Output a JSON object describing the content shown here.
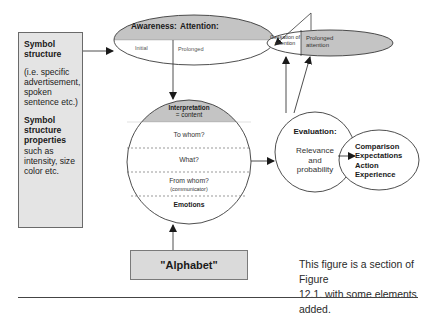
{
  "symbol_structure": {
    "title_line1": "Symbol",
    "title_line2": "structure",
    "example_lines": [
      "(i.e. specific",
      "advertisement,",
      "spoken",
      "sentence etc.)"
    ],
    "props_title_lines": [
      "Symbol",
      "structure",
      "properties"
    ],
    "props_lines": [
      "such as",
      "intensity, size",
      "color etc."
    ]
  },
  "awareness": {
    "label_left": "Awareness:",
    "label_right": "Attention:",
    "sub_left": "Initial",
    "sub_right": "Prolonged"
  },
  "attention_outcome": {
    "left_line1": "Cessation of",
    "left_line2": "attention",
    "right_line1": "Prolonged",
    "right_line2": "attention"
  },
  "interpretation": {
    "title_line1": "Interpretation",
    "title_line2": "= content",
    "rows": [
      "To whom?",
      "What?",
      "From whom?",
      "(communicator)"
    ],
    "footer": "Emotions"
  },
  "evaluation": {
    "title": "Evaluation:",
    "lines": [
      "Relevance",
      "and",
      "probability"
    ]
  },
  "outcome": {
    "lines": [
      "Comparison",
      "Expectations",
      "Action",
      "Experience"
    ]
  },
  "alphabet": {
    "label": "\"Alphabet\""
  },
  "caption": {
    "line1": "This figure is a section of Figure",
    "line2": "12.1. with some elements added."
  },
  "colors": {
    "shade": "#c4c4c4",
    "box_fill": "#e4e4e4",
    "line": "#3a3a3a"
  }
}
